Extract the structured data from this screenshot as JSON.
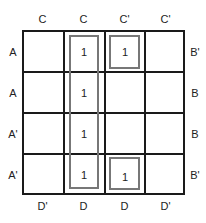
{
  "kmap": {
    "top_labels": [
      "C",
      "C",
      "C'",
      "C'"
    ],
    "bottom_labels": [
      "D'",
      "D",
      "D",
      "D'"
    ],
    "left_labels": [
      "A",
      "A",
      "A'",
      "A'"
    ],
    "right_labels": [
      "B'",
      "B",
      "B",
      "B'"
    ],
    "cells": [
      [
        "",
        "1",
        "1",
        ""
      ],
      [
        "",
        "1",
        "",
        ""
      ],
      [
        "",
        "1",
        "",
        ""
      ],
      [
        "",
        "1",
        "1",
        ""
      ]
    ]
  }
}
